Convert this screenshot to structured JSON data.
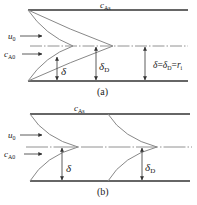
{
  "figure": {
    "panel_a": {
      "caption": "(a)",
      "wall_label": "c",
      "wall_label_sub": "As",
      "velocity_label": "u",
      "velocity_label_sub": "0",
      "conc_label": "c",
      "conc_label_sub": "A0",
      "delta_label": "δ",
      "deltaD_label": "δ",
      "deltaD_label_sub": "D",
      "equation": {
        "lhs": "δ",
        "eq1": "=",
        "mid": "δ",
        "mid_sub": "D",
        "eq2": "=",
        "rhs": "r",
        "rhs_sub": "i"
      }
    },
    "panel_b": {
      "caption": "(b)",
      "wall_label": "c",
      "wall_label_sub": "As",
      "velocity_label": "u",
      "velocity_label_sub": "0",
      "conc_label": "c",
      "conc_label_sub": "A0",
      "delta_label": "δ",
      "deltaD_label": "δ",
      "deltaD_label_sub": "D"
    },
    "colors": {
      "wall": "#333333",
      "curve": "#888888",
      "centerline": "#777777",
      "arrow": "#333333"
    }
  }
}
